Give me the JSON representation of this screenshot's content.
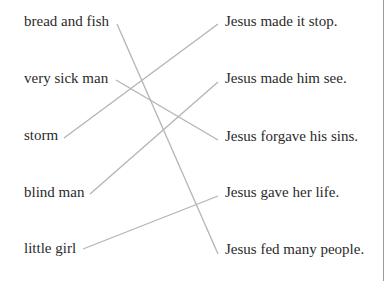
{
  "left_items": [
    {
      "label": "bread and fish",
      "x": 24,
      "y": 12
    },
    {
      "label": "very sick man",
      "x": 24,
      "y": 69
    },
    {
      "label": "storm",
      "x": 24,
      "y": 126
    },
    {
      "label": "blind man",
      "x": 24,
      "y": 183
    },
    {
      "label": "little girl",
      "x": 24,
      "y": 239
    }
  ],
  "right_items": [
    {
      "label": "Jesus made it stop.",
      "x": 225,
      "y": 12
    },
    {
      "label": "Jesus made him see.",
      "x": 225,
      "y": 69
    },
    {
      "label": "Jesus forgave his sins.",
      "x": 225,
      "y": 127
    },
    {
      "label": "Jesus gave her life.",
      "x": 225,
      "y": 183
    },
    {
      "label": "Jesus fed many people.",
      "x": 225,
      "y": 240
    }
  ],
  "connections": [
    {
      "from": "bread and fish",
      "to": "Jesus fed many people."
    },
    {
      "from": "very sick man",
      "to": "Jesus forgave his sins."
    },
    {
      "from": "storm",
      "to": "Jesus made it stop."
    },
    {
      "from": "blind man",
      "to": "Jesus made him see."
    },
    {
      "from": "little girl",
      "to": "Jesus gave her life."
    }
  ],
  "colors": {
    "line": "#b4b4b4",
    "text": "#2a2a2a"
  }
}
